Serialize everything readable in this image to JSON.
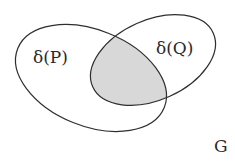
{
  "diagram": {
    "type": "venn",
    "sets": [
      {
        "id": "P",
        "label": "δ(P)"
      },
      {
        "id": "Q",
        "label": "δ(Q)"
      }
    ],
    "universe_label": "G",
    "shaded_region": "δ(P) ∩ δ(Q)",
    "colors": {
      "stroke": "#2e2e2e",
      "shade": "#d6d6d6",
      "background": "#ffffff"
    }
  }
}
